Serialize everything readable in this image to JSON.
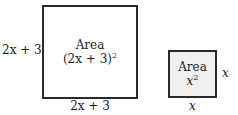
{
  "big_square": {
    "side_left_label": "2x + 3",
    "side_bottom_label": "2x + 3",
    "area_title": "Area",
    "area_expr_base": "(2x + 3)",
    "area_expr_exp": "2"
  },
  "small_square": {
    "side_right_label": "x",
    "side_bottom_label": "x",
    "area_title": "Area",
    "area_expr_base": "x",
    "area_expr_exp": "2"
  },
  "colors": {
    "big_fill": "#ffffff",
    "small_fill": "#f0f0f0",
    "stroke": "#2a2a2a"
  }
}
